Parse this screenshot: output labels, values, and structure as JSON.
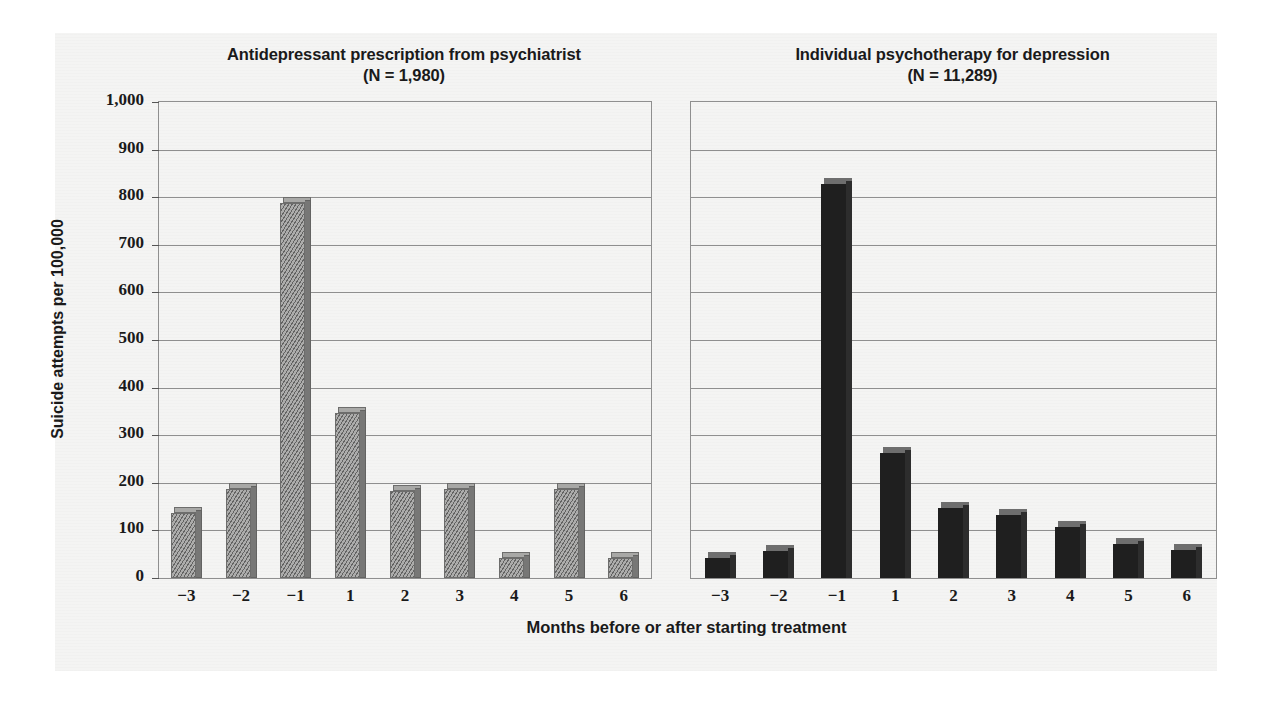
{
  "figure": {
    "background_color": "#f4f4f3",
    "bar_color_left": "#888887",
    "bar_color_right": "#1f1f1f",
    "axis_color": "#8f8f8f"
  },
  "chart_data": {
    "type": "bar",
    "title": "",
    "xlabel": "Months before or after starting treatment",
    "ylabel": "Suicide attempts per 100,000",
    "ylim": [
      0,
      1000
    ],
    "ytick_labels": [
      "1,000",
      "900",
      "800",
      "700",
      "600",
      "500",
      "400",
      "300",
      "200",
      "100",
      "0"
    ],
    "ytick_values": [
      1000,
      900,
      800,
      700,
      600,
      500,
      400,
      300,
      200,
      100,
      0
    ],
    "grid": true,
    "legend": "none",
    "categories": [
      "−3",
      "−2",
      "−1",
      "1",
      "2",
      "3",
      "4",
      "5",
      "6"
    ],
    "panels": [
      {
        "key": "antidepressant",
        "title_line1": "Antidepressant prescription from psychiatrist",
        "title_line2": "(N = 1,980)",
        "n_label": "(N = 1,980)",
        "style": "gray-hatched",
        "values": [
          150,
          200,
          800,
          360,
          195,
          200,
          55,
          200,
          55
        ]
      },
      {
        "key": "psychotherapy",
        "title_line1": "Individual psychotherapy for depression",
        "title_line2": "(N = 11,289)",
        "n_label": "(N = 11,289)",
        "style": "dark-solid",
        "values": [
          55,
          70,
          840,
          275,
          160,
          145,
          120,
          85,
          72
        ]
      }
    ]
  }
}
